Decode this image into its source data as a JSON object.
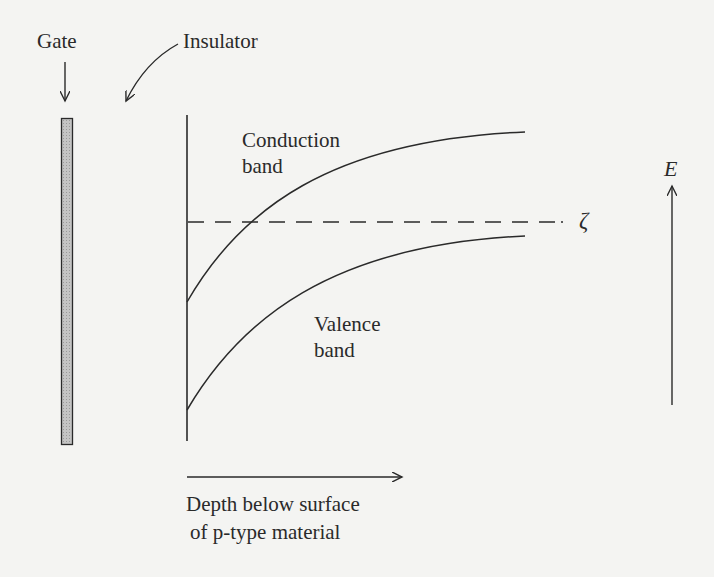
{
  "diagram": {
    "labels": {
      "gate": "Gate",
      "insulator": "Insulator",
      "conduction_line1": "Conduction",
      "conduction_line2": "band",
      "valence_line1": "Valence",
      "valence_line2": "band",
      "fermi_level": "ζ",
      "energy_axis": "E",
      "depth_line1": "Depth below surface",
      "depth_line2": "of p-type material"
    },
    "colors": {
      "line": "#2a2a2a",
      "gate_fill": "#b8b8b8",
      "background": "#f4f4f2"
    }
  }
}
